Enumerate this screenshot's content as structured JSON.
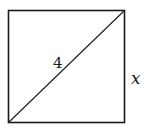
{
  "diagram": {
    "type": "square-with-diagonal",
    "shape": "square",
    "diagonal_label": "4",
    "side_label": "x",
    "stroke_color": "#1a1a1a",
    "background": "#ffffff"
  }
}
